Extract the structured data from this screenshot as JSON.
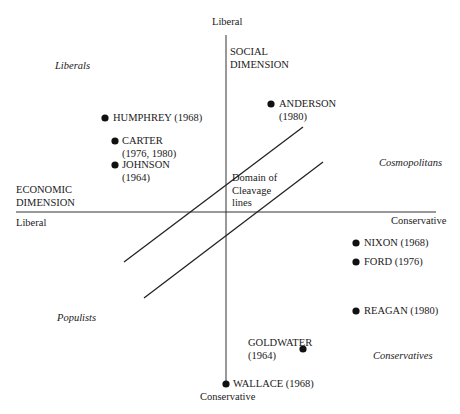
{
  "axes": {
    "social": {
      "name": "SOCIAL DIMENSION",
      "name_line1": "SOCIAL",
      "name_line2": "DIMENSION",
      "top_label": "Liberal",
      "bottom_label": "Conservative"
    },
    "economic": {
      "name": "ECONOMIC DIMENSION",
      "name_line1": "ECONOMIC",
      "name_line2": "DIMENSION",
      "left_label": "Liberal",
      "right_label": "Conservative"
    }
  },
  "quadrants": {
    "top_left": "Liberals",
    "top_right": "Cosmopolitans",
    "bottom_left": "Populists",
    "bottom_right": "Conservatives"
  },
  "cleavage": {
    "line1": "Domain of",
    "line2": "Cleavage",
    "line3": "lines"
  },
  "candidates": [
    {
      "name": "HUMPHREY (1968)",
      "line1": "HUMPHREY (1968)",
      "line2": ""
    },
    {
      "name": "CARTER (1976, 1980)",
      "line1": "CARTER",
      "line2": "(1976, 1980)"
    },
    {
      "name": "JOHNSON (1964)",
      "line1": "JOHNSON",
      "line2": "(1964)"
    },
    {
      "name": "ANDERSON (1980)",
      "line1": "ANDERSON",
      "line2": "(1980)"
    },
    {
      "name": "NIXON (1968)",
      "line1": "NIXON (1968)",
      "line2": ""
    },
    {
      "name": "FORD (1976)",
      "line1": "FORD (1976)",
      "line2": ""
    },
    {
      "name": "REAGAN (1980)",
      "line1": "REAGAN (1980)",
      "line2": ""
    },
    {
      "name": "GOLDWATER (1964)",
      "line1": "GOLDWATER",
      "line2": "(1964)"
    },
    {
      "name": "WALLACE (1968)",
      "line1": "WALLACE (1968)",
      "line2": ""
    }
  ],
  "colors": {
    "ink": "#1a1a1a",
    "axis": "#333333",
    "background": "#ffffff"
  }
}
